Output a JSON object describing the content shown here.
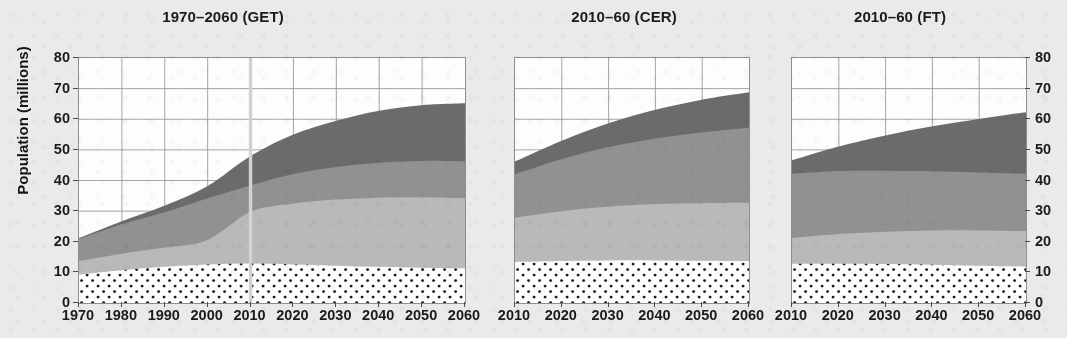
{
  "figure": {
    "background_color": "#ebeaea",
    "axis_title_y": "Population (millions)",
    "y_ticks": [
      0,
      10,
      20,
      30,
      40,
      50,
      60,
      70,
      80
    ],
    "y_axis_min": 0,
    "y_axis_max": 80
  },
  "colors": {
    "layer_dark": "#6b6b6b",
    "layer_medium": "#919191",
    "layer_light": "#b9b9b9",
    "layer_dotted_fill": "#fdfdfd",
    "layer_dotted_dot": "#1a1a1a",
    "grid": "#9a9a9a",
    "frame": "#8e8e8e",
    "text": "#1b1b1b"
  },
  "panels": [
    {
      "id": "get",
      "title": "1970–2060 (GET)",
      "x_ticks": [
        1970,
        1980,
        1990,
        2000,
        2010,
        2020,
        2030,
        2040,
        2050,
        2060
      ],
      "y_labels_side": "left",
      "marker_year": 2010
    },
    {
      "id": "cer",
      "title": "2010–60 (CER)",
      "x_ticks": [
        2010,
        2020,
        2030,
        2040,
        2050,
        2060
      ],
      "y_labels_side": "none",
      "marker_year": null
    },
    {
      "id": "ft",
      "title": "2010–60 (FT)",
      "x_ticks": [
        2010,
        2020,
        2030,
        2040,
        2050,
        2060
      ],
      "y_labels_side": "right",
      "marker_year": null
    }
  ],
  "chart_data": [
    {
      "type": "area",
      "stacked": true,
      "title": "1970–2060 (GET)",
      "xlabel": "",
      "ylabel": "Population (millions)",
      "ylim": [
        0,
        80
      ],
      "xlim": [
        1970,
        2060
      ],
      "grid": true,
      "legend": "none",
      "x": [
        1970,
        1980,
        1990,
        2000,
        2010,
        2020,
        2030,
        2040,
        2050,
        2060
      ],
      "series": [
        {
          "name": "layer-1-dotted",
          "fill": "dotted-white",
          "values": [
            9.3,
            10.7,
            11.8,
            12.6,
            12.9,
            12.6,
            12.2,
            11.8,
            11.5,
            11.3
          ]
        },
        {
          "name": "layer-2-light",
          "fill": "#b9b9b9",
          "values": [
            4.4,
            5.4,
            6.3,
            8.0,
            16.9,
            19.9,
            21.6,
            22.6,
            23.0,
            22.9
          ]
        },
        {
          "name": "layer-3-medium",
          "fill": "#919191",
          "values": [
            7.2,
            9.6,
            11.5,
            13.6,
            8.6,
            9.6,
            10.6,
            11.4,
            11.9,
            12.0
          ]
        },
        {
          "name": "layer-4-dark",
          "fill": "#6b6b6b",
          "values": [
            0.3,
            1.0,
            2.2,
            4.0,
            9.6,
            12.9,
            15.1,
            17.0,
            18.2,
            19.0
          ]
        }
      ],
      "stack_totals": [
        21.2,
        26.7,
        31.8,
        38.2,
        48.0,
        55.0,
        59.5,
        62.8,
        64.6,
        65.2
      ],
      "annotations": [
        {
          "type": "vertical-line",
          "x": 2010,
          "color": "#d2d2d2"
        }
      ]
    },
    {
      "type": "area",
      "stacked": true,
      "title": "2010–60 (CER)",
      "xlabel": "",
      "ylabel": "",
      "ylim": [
        0,
        80
      ],
      "xlim": [
        2010,
        2060
      ],
      "grid": true,
      "legend": "none",
      "x": [
        2010,
        2020,
        2030,
        2040,
        2050,
        2060
      ],
      "series": [
        {
          "name": "layer-1-dotted",
          "fill": "dotted-white",
          "values": [
            13.4,
            13.7,
            13.9,
            13.9,
            13.8,
            13.7
          ]
        },
        {
          "name": "layer-2-light",
          "fill": "#b9b9b9",
          "values": [
            14.5,
            16.3,
            17.6,
            18.4,
            18.8,
            19.0
          ]
        },
        {
          "name": "layer-3-medium",
          "fill": "#919191",
          "values": [
            14.1,
            17.0,
            19.4,
            21.4,
            23.1,
            24.5
          ]
        },
        {
          "name": "layer-4-dark",
          "fill": "#6b6b6b",
          "values": [
            4.2,
            6.0,
            7.8,
            9.4,
            10.7,
            11.6
          ]
        }
      ],
      "stack_totals": [
        46.2,
        53.0,
        58.7,
        63.1,
        66.4,
        68.8
      ]
    },
    {
      "type": "area",
      "stacked": true,
      "title": "2010–60 (FT)",
      "xlabel": "",
      "ylabel": "Population (millions)",
      "ylim": [
        0,
        80
      ],
      "xlim": [
        2010,
        2060
      ],
      "grid": true,
      "legend": "none",
      "x": [
        2010,
        2020,
        2030,
        2040,
        2050,
        2060
      ],
      "series": [
        {
          "name": "layer-1-dotted",
          "fill": "dotted-white",
          "values": [
            12.8,
            12.8,
            12.7,
            12.5,
            12.2,
            11.9
          ]
        },
        {
          "name": "layer-2-light",
          "fill": "#b9b9b9",
          "values": [
            8.4,
            9.7,
            10.6,
            11.2,
            11.5,
            11.6
          ]
        },
        {
          "name": "layer-3-medium",
          "fill": "#919191",
          "values": [
            21.0,
            20.6,
            19.9,
            19.3,
            18.9,
            18.7
          ]
        },
        {
          "name": "layer-4-dark",
          "fill": "#6b6b6b",
          "values": [
            4.4,
            8.0,
            11.5,
            14.7,
            17.5,
            20.1
          ]
        }
      ],
      "stack_totals": [
        46.6,
        51.1,
        54.7,
        57.7,
        60.1,
        62.3
      ]
    }
  ]
}
